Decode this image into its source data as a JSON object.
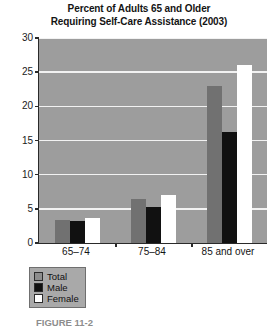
{
  "chart_data": {
    "type": "bar",
    "title": "Percent of Adults 65 and Older Requiring Self-Care Assistance (2003)",
    "title_lines": [
      "Percent of Adults 65 and Older",
      "Requiring Self-Care Assistance (2003)"
    ],
    "xlabel": "",
    "ylabel": "",
    "ylim": [
      0,
      30
    ],
    "yticks": [
      0,
      5,
      10,
      15,
      20,
      25,
      30
    ],
    "ytick_labels": [
      "0",
      "5",
      "10",
      "15",
      "20",
      "25",
      "30"
    ],
    "grid": true,
    "legend_position": "below-left",
    "categories": [
      "65–74",
      "75–84",
      "85 and over"
    ],
    "series": [
      {
        "name": "Total",
        "color": "#717171",
        "values": [
          3.4,
          6.5,
          23.0
        ]
      },
      {
        "name": "Male",
        "color": "#111111",
        "values": [
          3.2,
          5.3,
          16.2
        ]
      },
      {
        "name": "Female",
        "color": "#ffffff",
        "values": [
          3.6,
          7.0,
          26.0
        ]
      }
    ]
  },
  "caption": {
    "text": "FIGURE 11-2"
  },
  "colors": {
    "plot_background": "#9d9d9d",
    "gridline": "#f2f2f2",
    "axis": "#2a2a2a",
    "legend_background": "#a9a9a9"
  }
}
